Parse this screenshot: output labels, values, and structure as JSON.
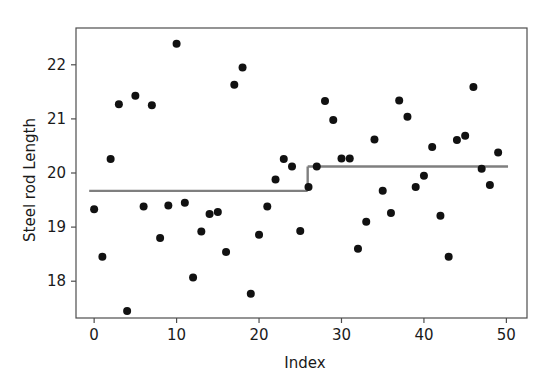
{
  "chart_data": {
    "type": "scatter",
    "title": "",
    "xlabel": "Index",
    "ylabel": "Steel rod Length",
    "xlim": [
      -2.2,
      52.5
    ],
    "ylim": [
      17.32,
      22.68
    ],
    "grid": false,
    "legend": null,
    "xticks": [
      0,
      10,
      20,
      30,
      40,
      50
    ],
    "xtick_labels": [
      "0",
      "10",
      "20",
      "30",
      "40",
      "50"
    ],
    "yticks": [
      18,
      19,
      20,
      21,
      22
    ],
    "ytick_labels": [
      "18",
      "19",
      "20",
      "21",
      "22"
    ],
    "marker_color": "#111111",
    "marker_size": 4.0,
    "x": [
      0,
      1,
      2,
      3,
      4,
      5,
      6,
      7,
      8,
      9,
      10,
      11,
      12,
      13,
      14,
      15,
      16,
      17,
      18,
      19,
      20,
      21,
      22,
      23,
      24,
      25,
      26,
      27,
      28,
      29,
      30,
      31,
      32,
      33,
      34,
      35,
      36,
      37,
      38,
      39,
      40,
      41,
      42,
      43,
      44,
      45,
      46,
      47,
      48,
      49
    ],
    "y": [
      19.33,
      18.45,
      20.26,
      21.27,
      17.45,
      21.43,
      19.38,
      21.25,
      18.8,
      19.4,
      22.39,
      19.45,
      18.07,
      18.92,
      19.24,
      19.28,
      18.54,
      21.63,
      21.95,
      17.77,
      18.86,
      19.38,
      19.88,
      20.26,
      20.12,
      18.93,
      19.74,
      20.12,
      21.33,
      20.98,
      20.27,
      20.27,
      18.6,
      19.1,
      20.62,
      19.67,
      19.26,
      21.34,
      21.04,
      19.74,
      19.95,
      20.48,
      19.21,
      18.45,
      20.61,
      20.69,
      21.59,
      20.08,
      19.78,
      20.38
    ],
    "step_lines": [
      {
        "name": "phase-1-mean",
        "x_start": -0.6,
        "x_end": 25.9,
        "value": 19.67,
        "color": "#7f7f7f"
      },
      {
        "name": "phase-2-mean",
        "x_start": 25.9,
        "x_end": 50.2,
        "value": 20.12,
        "color": "#7f7f7f"
      }
    ],
    "connector": {
      "x": 25.9,
      "y_from": 19.67,
      "y_to": 20.12,
      "color": "#7f7f7f"
    }
  }
}
